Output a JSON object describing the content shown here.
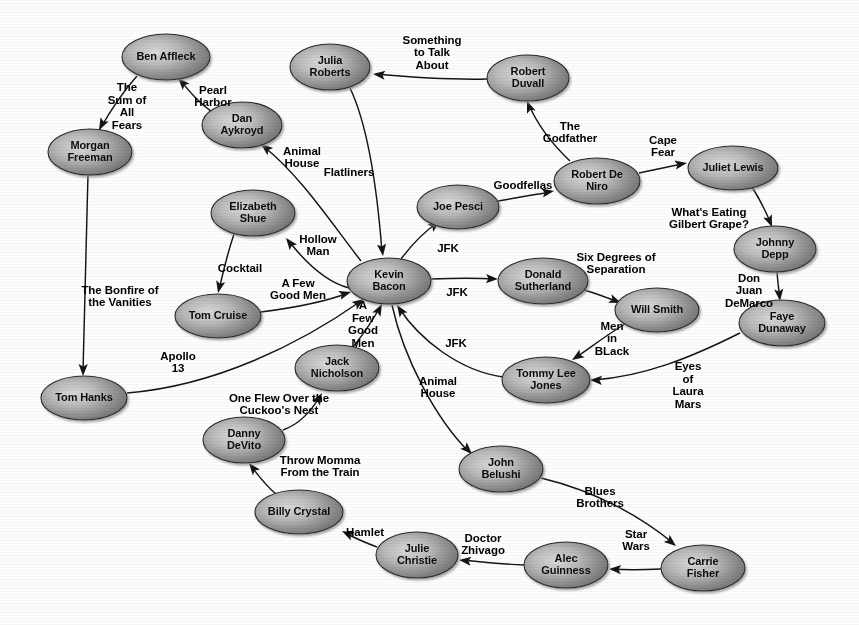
{
  "figure": {
    "name": "six-degrees-of-kevin-bacon-graph",
    "background_color": "#fdfdfd",
    "node_fill_light": "#cfcfcf",
    "node_fill_dark": "#6d6d6d",
    "node_stroke_color": "#2a2a2a",
    "edge_color": "#151515",
    "label_color": "#000000"
  },
  "chart_data": {
    "type": "diagram",
    "title": "",
    "graph_kind": "directed node-link graph",
    "node_shape": "ellipse",
    "nodes": [
      {
        "id": "ben_affleck",
        "label": "Ben Affleck",
        "cx": 166,
        "cy": 57,
        "rx": 44,
        "ry": 23
      },
      {
        "id": "julia_roberts",
        "label": "Julia\nRoberts",
        "cx": 330,
        "cy": 67,
        "rx": 40,
        "ry": 23
      },
      {
        "id": "robert_duvall",
        "label": "Robert\nDuvall",
        "cx": 528,
        "cy": 78,
        "rx": 41,
        "ry": 23
      },
      {
        "id": "dan_aykroyd",
        "label": "Dan\nAykroyd",
        "cx": 242,
        "cy": 125,
        "rx": 40,
        "ry": 23
      },
      {
        "id": "morgan_freeman",
        "label": "Morgan\nFreeman",
        "cx": 90,
        "cy": 152,
        "rx": 42,
        "ry": 23
      },
      {
        "id": "juliet_lewis",
        "label": "Juliet Lewis",
        "cx": 733,
        "cy": 168,
        "rx": 45,
        "ry": 22
      },
      {
        "id": "robert_de_niro",
        "label": "Robert De\nNiro",
        "cx": 597,
        "cy": 181,
        "rx": 43,
        "ry": 23
      },
      {
        "id": "elizabeth_shue",
        "label": "Elizabeth\nShue",
        "cx": 253,
        "cy": 213,
        "rx": 42,
        "ry": 23
      },
      {
        "id": "joe_pesci",
        "label": "Joe Pesci",
        "cx": 458,
        "cy": 207,
        "rx": 41,
        "ry": 22
      },
      {
        "id": "johnny_depp",
        "label": "Johnny\nDepp",
        "cx": 775,
        "cy": 249,
        "rx": 41,
        "ry": 23
      },
      {
        "id": "kevin_bacon",
        "label": "Kevin\nBacon",
        "cx": 389,
        "cy": 281,
        "rx": 42,
        "ry": 23
      },
      {
        "id": "donald_sutherland",
        "label": "Donald\nSutherland",
        "cx": 543,
        "cy": 281,
        "rx": 45,
        "ry": 23
      },
      {
        "id": "will_smith",
        "label": "Will Smith",
        "cx": 657,
        "cy": 310,
        "rx": 42,
        "ry": 22
      },
      {
        "id": "tom_cruise",
        "label": "Tom Cruise",
        "cx": 218,
        "cy": 316,
        "rx": 43,
        "ry": 22
      },
      {
        "id": "faye_dunaway",
        "label": "Faye\nDunaway",
        "cx": 782,
        "cy": 323,
        "rx": 43,
        "ry": 23
      },
      {
        "id": "jack_nicholson",
        "label": "Jack\nNicholson",
        "cx": 337,
        "cy": 368,
        "rx": 42,
        "ry": 23
      },
      {
        "id": "tommy_lee_jones",
        "label": "Tommy Lee\nJones",
        "cx": 546,
        "cy": 380,
        "rx": 44,
        "ry": 23
      },
      {
        "id": "tom_hanks",
        "label": "Tom Hanks",
        "cx": 84,
        "cy": 398,
        "rx": 43,
        "ry": 22
      },
      {
        "id": "danny_devito",
        "label": "Danny\nDeVito",
        "cx": 244,
        "cy": 440,
        "rx": 41,
        "ry": 23
      },
      {
        "id": "john_belushi",
        "label": "John\nBelushi",
        "cx": 501,
        "cy": 469,
        "rx": 42,
        "ry": 23
      },
      {
        "id": "billy_crystal",
        "label": "Billy Crystal",
        "cx": 299,
        "cy": 512,
        "rx": 44,
        "ry": 22
      },
      {
        "id": "carrie_fisher",
        "label": "Carrie\nFisher",
        "cx": 703,
        "cy": 568,
        "rx": 42,
        "ry": 23
      },
      {
        "id": "alec_guinness",
        "label": "Alec\nGuinness",
        "cx": 566,
        "cy": 565,
        "rx": 42,
        "ry": 23
      },
      {
        "id": "julie_christie",
        "label": "Julie\nChristie",
        "cx": 417,
        "cy": 555,
        "rx": 41,
        "ry": 23
      }
    ],
    "edges": [
      {
        "from": "ben_affleck",
        "to": "morgan_freeman",
        "label": "The\nSum of\nAll\nFears",
        "label_x": 127,
        "label_y": 107,
        "path": "M 137,76 C 120,95 108,115 100,129",
        "head": {
          "x": 99,
          "y": 130,
          "angle": 118
        }
      },
      {
        "from": "dan_aykroyd",
        "to": "ben_affleck",
        "label": "Pearl\nHarbor",
        "label_x": 213,
        "label_y": 97,
        "path": "M 212,112 C 198,102 190,92 180,80",
        "head": {
          "x": 178,
          "y": 78,
          "angle": 227
        }
      },
      {
        "from": "kevin_bacon",
        "to": "dan_aykroyd",
        "label": "Animal\nHouse",
        "label_x": 302,
        "label_y": 158,
        "path": "M 361,261 C 332,224 300,175 263,146",
        "head": {
          "x": 261,
          "y": 144,
          "angle": 219
        }
      },
      {
        "from": "robert_duvall",
        "to": "julia_roberts",
        "label": "Something\nto Talk\nAbout",
        "label_x": 432,
        "label_y": 53,
        "path": "M 487,79 C 450,80 420,78 376,74",
        "head": {
          "x": 373,
          "y": 74,
          "angle": 186
        }
      },
      {
        "from": "julia_roberts",
        "to": "kevin_bacon",
        "label": "Flatliners",
        "label_x": 349,
        "label_y": 173,
        "path": "M 350,88 C 370,130 378,200 382,252",
        "head": {
          "x": 383,
          "y": 256,
          "angle": 83
        }
      },
      {
        "from": "morgan_freeman",
        "to": "tom_hanks",
        "label": "The Bonfire of\nthe Vanities",
        "label_x": 120,
        "label_y": 297,
        "path": "M 88,175 C 86,250 84,330 83,372",
        "head": {
          "x": 83,
          "y": 376,
          "angle": 91
        }
      },
      {
        "from": "robert_de_niro",
        "to": "robert_duvall",
        "label": "The\nGodfather",
        "label_x": 570,
        "label_y": 133,
        "path": "M 570,161 C 552,144 537,124 528,103",
        "head": {
          "x": 527,
          "y": 101,
          "angle": 249
        }
      },
      {
        "from": "robert_de_niro",
        "to": "juliet_lewis",
        "label": "Cape\nFear",
        "label_x": 663,
        "label_y": 147,
        "path": "M 639,173 C 655,170 670,166 684,164",
        "head": {
          "x": 687,
          "y": 163,
          "angle": 350
        }
      },
      {
        "from": "joe_pesci",
        "to": "robert_de_niro",
        "label": "Goodfellas",
        "label_x": 523,
        "label_y": 186,
        "path": "M 498,201 C 515,198 532,195 551,192",
        "head": {
          "x": 554,
          "y": 191,
          "angle": 350
        }
      },
      {
        "from": "kevin_bacon",
        "to": "joe_pesci",
        "label": "JFK",
        "label_x": 448,
        "label_y": 249,
        "path": "M 401,259 C 413,243 424,232 437,223",
        "head": {
          "x": 440,
          "y": 221,
          "angle": 323
        }
      },
      {
        "from": "juliet_lewis",
        "to": "johnny_depp",
        "label": "What's Eating\nGilbert Grape?",
        "label_x": 709,
        "label_y": 219,
        "path": "M 752,187 C 762,203 767,214 771,224",
        "head": {
          "x": 772,
          "y": 227,
          "angle": 68
        }
      },
      {
        "from": "kevin_bacon",
        "to": "elizabeth_shue",
        "label": "Hollow\nMan",
        "label_x": 318,
        "label_y": 246,
        "path": "M 349,288 C 326,282 305,262 288,240",
        "head": {
          "x": 286,
          "y": 238,
          "angle": 232
        }
      },
      {
        "from": "elizabeth_shue",
        "to": "tom_cruise",
        "label": "Cocktail",
        "label_x": 240,
        "label_y": 269,
        "path": "M 234,234 C 228,252 223,272 219,290",
        "head": {
          "x": 218,
          "y": 293,
          "angle": 103
        }
      },
      {
        "from": "tom_cruise",
        "to": "kevin_bacon",
        "label": "A Few\nGood Men",
        "label_x": 298,
        "label_y": 290,
        "path": "M 261,312 C 300,307 330,300 348,293",
        "head": {
          "x": 351,
          "y": 292,
          "angle": 344
        }
      },
      {
        "from": "kevin_bacon",
        "to": "donald_sutherland",
        "label": "JFK",
        "label_x": 457,
        "label_y": 293,
        "path": "M 431,279 C 458,278 478,278 495,279",
        "head": {
          "x": 498,
          "y": 279,
          "angle": 2
        }
      },
      {
        "from": "donald_sutherland",
        "to": "will_smith",
        "label": "Six Degrees of\nSeparation",
        "label_x": 616,
        "label_y": 264,
        "path": "M 584,290 C 598,294 608,298 618,302",
        "head": {
          "x": 621,
          "y": 303,
          "angle": 22
        }
      },
      {
        "from": "johnny_depp",
        "to": "faye_dunaway",
        "label": "Don\nJuan\nDeMarco",
        "label_x": 749,
        "label_y": 291,
        "path": "M 777,272 C 778,284 779,292 780,298",
        "head": {
          "x": 780,
          "y": 301,
          "angle": 84
        }
      },
      {
        "from": "will_smith",
        "to": "tommy_lee_jones",
        "label": "Men\nin\nBLack",
        "label_x": 612,
        "label_y": 339,
        "path": "M 625,324 C 605,336 590,348 575,358",
        "head": {
          "x": 572,
          "y": 360,
          "angle": 147
        }
      },
      {
        "from": "tommy_lee_jones",
        "to": "kevin_bacon",
        "label": "JFK",
        "label_x": 456,
        "label_y": 344,
        "path": "M 503,377 C 460,371 420,340 399,308",
        "head": {
          "x": 397,
          "y": 305,
          "angle": 237
        }
      },
      {
        "from": "faye_dunaway",
        "to": "tommy_lee_jones",
        "label": "Eyes\nof\nLaura\nMars",
        "label_x": 688,
        "label_y": 386,
        "path": "M 740,333 C 690,358 645,376 594,380",
        "head": {
          "x": 590,
          "y": 380,
          "angle": 182
        }
      },
      {
        "from": "jack_nicholson",
        "to": "kevin_bacon",
        "label": "A\nFew\nGood\nMen",
        "label_x": 363,
        "label_y": 325,
        "path": "M 354,346 C 364,333 373,320 380,307",
        "head": {
          "x": 382,
          "y": 304,
          "angle": 298
        }
      },
      {
        "from": "tom_hanks",
        "to": "kevin_bacon",
        "label": "Apollo\n13",
        "label_x": 178,
        "label_y": 363,
        "path": "M 127,393 C 215,386 300,344 361,301",
        "head": {
          "x": 364,
          "y": 299,
          "angle": 325
        }
      },
      {
        "from": "kevin_bacon",
        "to": "john_belushi",
        "label": "Animal\nHouse",
        "label_x": 438,
        "label_y": 388,
        "path": "M 392,305 C 404,360 437,420 469,452",
        "head": {
          "x": 472,
          "y": 454,
          "angle": 45
        }
      },
      {
        "from": "danny_devito",
        "to": "jack_nicholson",
        "label": "One Flew Over the\nCuckoo's Nest",
        "label_x": 279,
        "label_y": 405,
        "path": "M 283,430 C 300,424 312,410 320,396",
        "head": {
          "x": 322,
          "y": 393,
          "angle": 300
        }
      },
      {
        "from": "billy_crystal",
        "to": "danny_devito",
        "label": "Throw Momma\nFrom the Train",
        "label_x": 320,
        "label_y": 467,
        "path": "M 276,494 C 266,486 258,475 251,466",
        "head": {
          "x": 249,
          "y": 463,
          "angle": 232
        }
      },
      {
        "from": "john_belushi",
        "to": "carrie_fisher",
        "label": "Blues\nBrothers",
        "label_x": 600,
        "label_y": 498,
        "path": "M 541,478 C 600,492 645,520 673,543",
        "head": {
          "x": 676,
          "y": 546,
          "angle": 39
        }
      },
      {
        "from": "carrie_fisher",
        "to": "alec_guinness",
        "label": "Star\nWars",
        "label_x": 636,
        "label_y": 541,
        "path": "M 661,569 C 640,570 625,570 612,569",
        "head": {
          "x": 609,
          "y": 569,
          "angle": 183
        }
      },
      {
        "from": "alec_guinness",
        "to": "julie_christie",
        "label": "Doctor\nZhivago",
        "label_x": 483,
        "label_y": 545,
        "path": "M 524,565 C 500,564 480,562 462,560",
        "head": {
          "x": 459,
          "y": 560,
          "angle": 186
        }
      },
      {
        "from": "julie_christie",
        "to": "billy_crystal",
        "label": "Hamlet",
        "label_x": 365,
        "label_y": 533,
        "path": "M 377,547 C 366,543 355,538 345,533",
        "head": {
          "x": 342,
          "y": 531,
          "angle": 206
        }
      }
    ]
  }
}
